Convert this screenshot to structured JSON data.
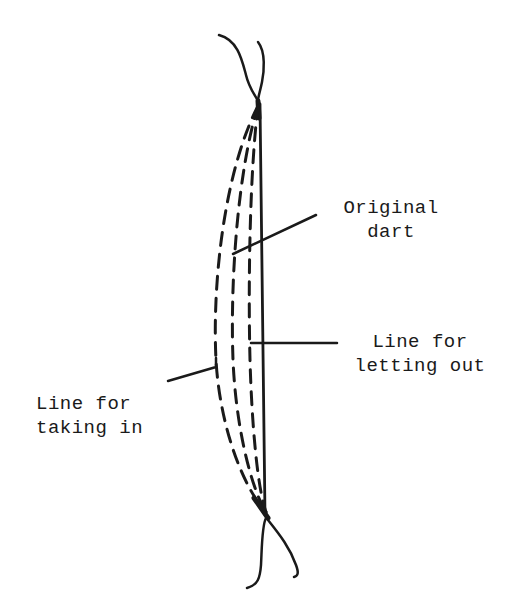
{
  "diagram": {
    "colors": {
      "ink": "#1a1a1a",
      "background": "#ffffff"
    },
    "labels": {
      "original_dart": {
        "line1": "Original",
        "line2": "dart"
      },
      "letting_out": {
        "line1": "Line for",
        "line2": "letting out"
      },
      "taking_in": {
        "line1": "Line for",
        "line2": "taking in"
      }
    }
  }
}
